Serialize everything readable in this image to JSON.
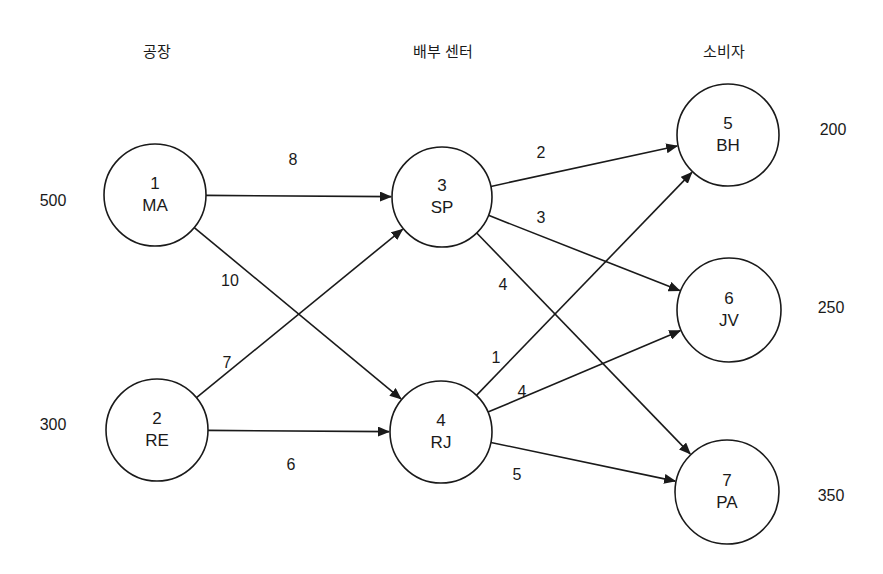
{
  "headers": [
    {
      "id": "plants",
      "label": "공장",
      "x": 157,
      "y": 52
    },
    {
      "id": "distribution",
      "label": "배부 센터",
      "x": 443,
      "y": 52
    },
    {
      "id": "consumers",
      "label": "소비자",
      "x": 724,
      "y": 52
    }
  ],
  "nodes": [
    {
      "id": 1,
      "num": "1",
      "name": "MA",
      "cx": 155,
      "cy": 195,
      "r": 51
    },
    {
      "id": 2,
      "num": "2",
      "name": "RE",
      "cx": 157,
      "cy": 430,
      "r": 51
    },
    {
      "id": 3,
      "num": "3",
      "name": "SP",
      "cx": 442,
      "cy": 197,
      "r": 50
    },
    {
      "id": 4,
      "num": "4",
      "name": "RJ",
      "cx": 441,
      "cy": 432,
      "r": 51
    },
    {
      "id": 5,
      "num": "5",
      "name": "BH",
      "cx": 728,
      "cy": 135,
      "r": 51
    },
    {
      "id": 6,
      "num": "6",
      "name": "JV",
      "cx": 729,
      "cy": 310,
      "r": 52
    },
    {
      "id": 7,
      "num": "7",
      "name": "PA",
      "cx": 727,
      "cy": 492,
      "r": 52
    }
  ],
  "supplies_demands": [
    {
      "node": 1,
      "value": "500",
      "x": 53,
      "y": 201
    },
    {
      "node": 2,
      "value": "300",
      "x": 53,
      "y": 425
    },
    {
      "node": 5,
      "value": "200",
      "x": 833,
      "y": 130
    },
    {
      "node": 6,
      "value": "250",
      "x": 831,
      "y": 308
    },
    {
      "node": 7,
      "value": "350",
      "x": 831,
      "y": 496
    }
  ],
  "edges": [
    {
      "from": 1,
      "to": 3,
      "cost": "8",
      "lx": 293,
      "ly": 160
    },
    {
      "from": 1,
      "to": 4,
      "cost": "10",
      "lx": 230,
      "ly": 281
    },
    {
      "from": 2,
      "to": 3,
      "cost": "7",
      "lx": 227,
      "ly": 363
    },
    {
      "from": 2,
      "to": 4,
      "cost": "6",
      "lx": 291,
      "ly": 465
    },
    {
      "from": 3,
      "to": 5,
      "cost": "2",
      "lx": 541,
      "ly": 153
    },
    {
      "from": 3,
      "to": 6,
      "cost": "3",
      "lx": 541,
      "ly": 218
    },
    {
      "from": 3,
      "to": 7,
      "cost": "4",
      "lx": 503,
      "ly": 285
    },
    {
      "from": 4,
      "to": 5,
      "cost": "1",
      "lx": 496,
      "ly": 358
    },
    {
      "from": 4,
      "to": 6,
      "cost": "4",
      "lx": 522,
      "ly": 392
    },
    {
      "from": 4,
      "to": 7,
      "cost": "5",
      "lx": 517,
      "ly": 475
    }
  ]
}
